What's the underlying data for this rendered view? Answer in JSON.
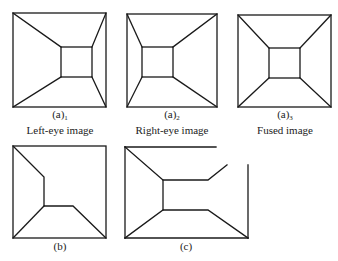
{
  "panels": [
    {
      "id": "a1",
      "label": "(a)",
      "subscript": "1",
      "caption": "Left-eye image"
    },
    {
      "id": "a2",
      "label": "(a)",
      "subscript": "2",
      "caption": "Right-eye image"
    },
    {
      "id": "a3",
      "label": "(a)",
      "subscript": "3",
      "caption": "Fused image"
    },
    {
      "id": "b",
      "label": "(b)"
    },
    {
      "id": "c",
      "label": "(c)"
    }
  ],
  "colors": {
    "line": "#1a1a1a",
    "background": "#ffffff"
  }
}
